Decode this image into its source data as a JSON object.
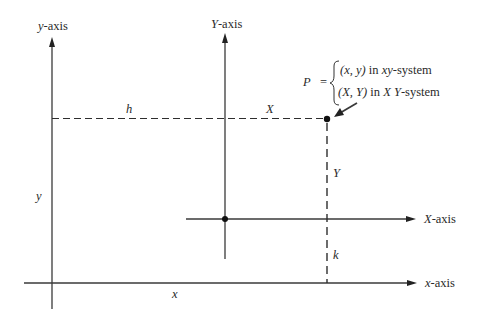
{
  "diagram": {
    "type": "coordinate-translation",
    "colors": {
      "line": "#3a3a3a",
      "text": "#2a2a2a",
      "background": "#ffffff"
    },
    "axes": {
      "y_axis": {
        "label_var": "y",
        "label_suffix": "-axis"
      },
      "x_axis": {
        "label_var": "x",
        "label_suffix": "-axis"
      },
      "Y_axis": {
        "label_var": "Y",
        "label_suffix": "-axis"
      },
      "X_axis": {
        "label_var": "X",
        "label_suffix": "-axis"
      }
    },
    "segment_labels": {
      "h": "h",
      "X": "X",
      "Y": "Y",
      "k": "k",
      "y": "y",
      "x": "x"
    },
    "point": {
      "name": "P",
      "equals": "=",
      "line1": {
        "coords": "(x, y)",
        "in": " in ",
        "system_var": "xy",
        "system_suffix": "-system"
      },
      "line2": {
        "coords": "(X, Y)",
        "in": " in ",
        "system_var": "X Y",
        "system_suffix": "-system"
      }
    }
  }
}
